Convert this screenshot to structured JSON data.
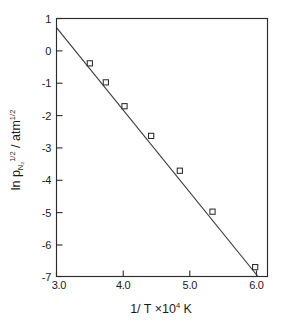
{
  "chart_data": {
    "type": "scatter",
    "title": "",
    "subtitle": "",
    "xlabel_parts": {
      "main": "1/ T ×10",
      "exponent": "4",
      "unit": " K"
    },
    "xlabel": "1/ T ×10⁴ K",
    "ylabel_parts": {
      "lead": "ln p",
      "sub": "N₂",
      "sup": "1/2",
      "mid": " / atm",
      "sup2": "1/2"
    },
    "ylabel": "ln p_N2^1/2 / atm^1/2",
    "xlim": [
      3.0,
      6.1
    ],
    "ylim": [
      -7,
      1
    ],
    "xticks": [
      3.0,
      4.0,
      5.0,
      6.0
    ],
    "xtick_labels": [
      "3.0",
      "4.0",
      "5.0",
      "6.0"
    ],
    "yticks": [
      1,
      0,
      -1,
      -2,
      -3,
      -4,
      -5,
      -6,
      -7
    ],
    "ytick_labels": [
      "1",
      "0",
      "-1",
      "-2",
      "-3",
      "-4",
      "-5",
      "-6",
      "-7"
    ],
    "grid": false,
    "legend": null,
    "marker_style": "open-square",
    "line_color": "#3a3a3a",
    "marker_edge_color": "#2b2b2b",
    "marker_face_color": "#ffffff",
    "frame_color": "#2b2b2b",
    "background_color": "#ffffff",
    "x": [
      3.5,
      3.74,
      4.02,
      4.42,
      4.85,
      5.34,
      5.98
    ],
    "y": [
      -0.39,
      -0.98,
      -1.72,
      -2.64,
      -3.72,
      -4.99,
      -6.71
    ],
    "points": [
      {
        "x": 3.5,
        "y": -0.39
      },
      {
        "x": 3.74,
        "y": -0.98
      },
      {
        "x": 4.02,
        "y": -1.72
      },
      {
        "x": 4.42,
        "y": -2.64
      },
      {
        "x": 4.85,
        "y": -3.72
      },
      {
        "x": 5.34,
        "y": -4.99
      },
      {
        "x": 5.98,
        "y": -6.71
      }
    ],
    "fit_line": {
      "x_start": 3.0,
      "y_start": 0.72,
      "x_end": 6.1,
      "y_end": -7.2,
      "slope": -2.555,
      "intercept": 8.385
    }
  }
}
